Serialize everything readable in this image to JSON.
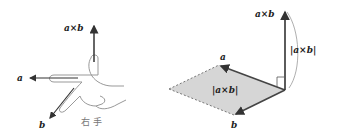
{
  "left_figure": {
    "title": "right-hand rule",
    "labels": {
      "cross": "a×b",
      "a": "a",
      "b": "b",
      "caption": "右 手"
    }
  },
  "right_figure": {
    "title": "cross product parallelogram",
    "labels": {
      "cross": "a×b",
      "magnitude_vertical": "|a×b|",
      "area": "|a×b|",
      "a": "a",
      "b": "b"
    },
    "colors": {
      "fill": "#d6d6d6",
      "vector": "#444444",
      "dashed": "#777777"
    }
  }
}
